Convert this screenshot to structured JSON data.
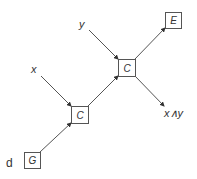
{
  "panel_label": "d",
  "nodes": [
    {
      "id": "G",
      "label": "G"
    },
    {
      "id": "C1",
      "label": "C"
    },
    {
      "id": "C2",
      "label": "C"
    },
    {
      "id": "E",
      "label": "E"
    }
  ],
  "inputs": [
    {
      "id": "x",
      "label": "x"
    },
    {
      "id": "y",
      "label": "y"
    }
  ],
  "outputs": [
    {
      "id": "xy",
      "label": "x∧y"
    }
  ],
  "edges": [
    {
      "from": "G",
      "to": "C1"
    },
    {
      "from": "x",
      "to": "C1"
    },
    {
      "from": "C1",
      "to": "C2"
    },
    {
      "from": "y",
      "to": "C2"
    },
    {
      "from": "C2",
      "to": "E"
    },
    {
      "from": "C2",
      "to": "xy"
    }
  ]
}
